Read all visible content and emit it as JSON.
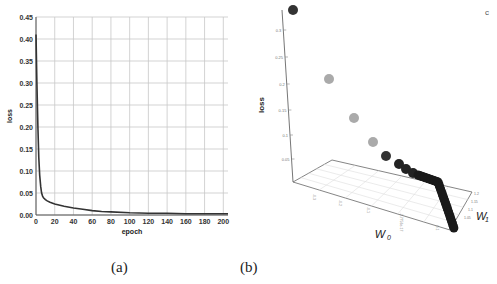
{
  "captions": {
    "a": "(a)",
    "b": "(b)"
  },
  "corner_mark": "c",
  "chart_data": [
    {
      "type": "line",
      "title": "",
      "xlabel": "epoch",
      "ylabel": "loss",
      "xlim": [
        0,
        205
      ],
      "ylim": [
        0,
        0.45
      ],
      "grid": true,
      "legend": "none",
      "x_ticks": [
        "0",
        "20",
        "40",
        "60",
        "80",
        "100",
        "120",
        "140",
        "160",
        "180",
        "200"
      ],
      "y_ticks": [
        "0.00",
        "0.05",
        "0.10",
        "0.15",
        "0.20",
        "0.25",
        "0.30",
        "0.35",
        "0.40",
        "0.45"
      ],
      "series": [
        {
          "name": "loss",
          "color": "#333333",
          "x": [
            0,
            1,
            2,
            3,
            4,
            5,
            6,
            7,
            8,
            10,
            12,
            15,
            20,
            30,
            40,
            50,
            60,
            70,
            80,
            100,
            120,
            140,
            160,
            180,
            200,
            205
          ],
          "y": [
            0.41,
            0.3,
            0.2,
            0.13,
            0.09,
            0.065,
            0.05,
            0.043,
            0.039,
            0.035,
            0.032,
            0.029,
            0.025,
            0.02,
            0.016,
            0.013,
            0.01,
            0.008,
            0.007,
            0.005,
            0.004,
            0.004,
            0.003,
            0.003,
            0.003,
            0.003
          ]
        }
      ]
    },
    {
      "type": "scatter",
      "title": "",
      "xlabel": "W0",
      "ylabel": "W1",
      "zlabel": "loss",
      "z_ticks": [
        "0.3",
        "0.25",
        "0.2",
        "0.15",
        "0.1",
        "0.05"
      ],
      "x_ticks": [
        "-0.3",
        "-0.2",
        "-0.1",
        "-2.7756e-17",
        "0.1"
      ],
      "y_ticks": [
        "1.2",
        "1.15",
        "1.1",
        "1.05"
      ],
      "grid": true,
      "legend": "none",
      "points": [
        {
          "z": 0.32,
          "color": "#333333"
        },
        {
          "z": 0.21,
          "color": "#aaaaaa"
        },
        {
          "z": 0.15,
          "color": "#aaaaaa"
        },
        {
          "z": 0.11,
          "color": "#aaaaaa"
        },
        {
          "z": 0.08,
          "color": "#333333"
        },
        {
          "z": 0.06,
          "color": "#222222"
        },
        {
          "z": 0.05,
          "color": "#222222"
        },
        {
          "z": 0.04,
          "color": "#222222"
        }
      ],
      "trail_description": "dense trail of dark points converging along the base plane toward W0≈0.1, W1≈1.05"
    }
  ]
}
